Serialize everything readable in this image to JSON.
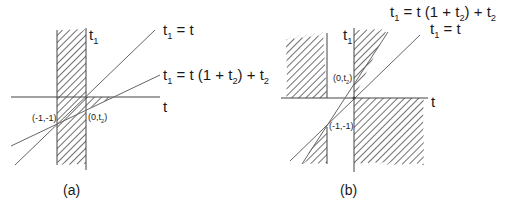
{
  "panels": [
    {
      "id": "a",
      "caption": "(a)",
      "axis_labels": {
        "vertical": "t",
        "vertical_sub": "1",
        "horizontal": "t"
      },
      "lines": [
        {
          "label_main": "t",
          "label_sub": "1",
          "label_rest": " = t"
        },
        {
          "label_main": "t",
          "label_sub": "1",
          "label_rest": " = t (1 + t",
          "label_sub2": "2",
          "label_tail": ") + t",
          "label_sub3": "2"
        }
      ],
      "points": [
        {
          "label": "(-1,-1)"
        },
        {
          "label_main": "(0,t",
          "label_sub": "2",
          "label_tail": ")"
        }
      ]
    },
    {
      "id": "b",
      "caption": "(b)",
      "axis_labels": {
        "vertical": "t",
        "vertical_sub": "1",
        "horizontal": "t"
      },
      "lines": [
        {
          "label_main": "t",
          "label_sub": "1",
          "label_rest": " = t (1 + t",
          "label_sub2": "2",
          "label_tail": ") + t",
          "label_sub3": "2"
        },
        {
          "label_main": "t",
          "label_sub": "1",
          "label_rest": " = t"
        }
      ],
      "points": [
        {
          "label_main": "(0,t",
          "label_sub": "2",
          "label_tail": ")"
        },
        {
          "label": "(-1,-1)"
        }
      ]
    }
  ],
  "colors": {
    "line": "#555555",
    "hatch": "#333333",
    "background": "#ffffff"
  }
}
